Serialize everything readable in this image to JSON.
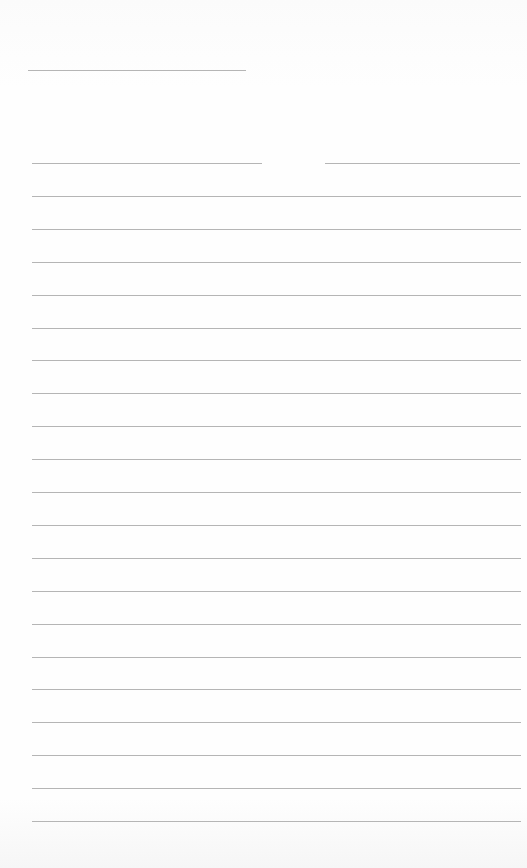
{
  "page": {
    "type": "lined-notebook-paper",
    "line_color": "#a8a8a8",
    "background": "#fdfdfd",
    "header_line": {
      "y": 70,
      "x1": 28,
      "x2": 246
    },
    "first_line_segments": [
      {
        "x1": 32,
        "x2": 262
      },
      {
        "x1": 325,
        "x2": 520
      }
    ],
    "ruled_lines": {
      "first_y": 163,
      "spacing": 32.9,
      "count": 21,
      "x1": 32,
      "x2": 521
    }
  }
}
